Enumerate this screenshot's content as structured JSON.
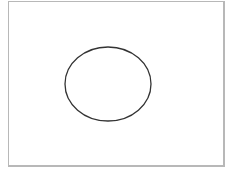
{
  "canvas": {
    "border_color": "#b8b8b8",
    "background": "#ffffff"
  },
  "shapes": [
    {
      "type": "ellipse",
      "cx": 108,
      "cy": 84,
      "rx": 43,
      "ry": 37,
      "stroke": "#333333",
      "fill": "none"
    }
  ]
}
